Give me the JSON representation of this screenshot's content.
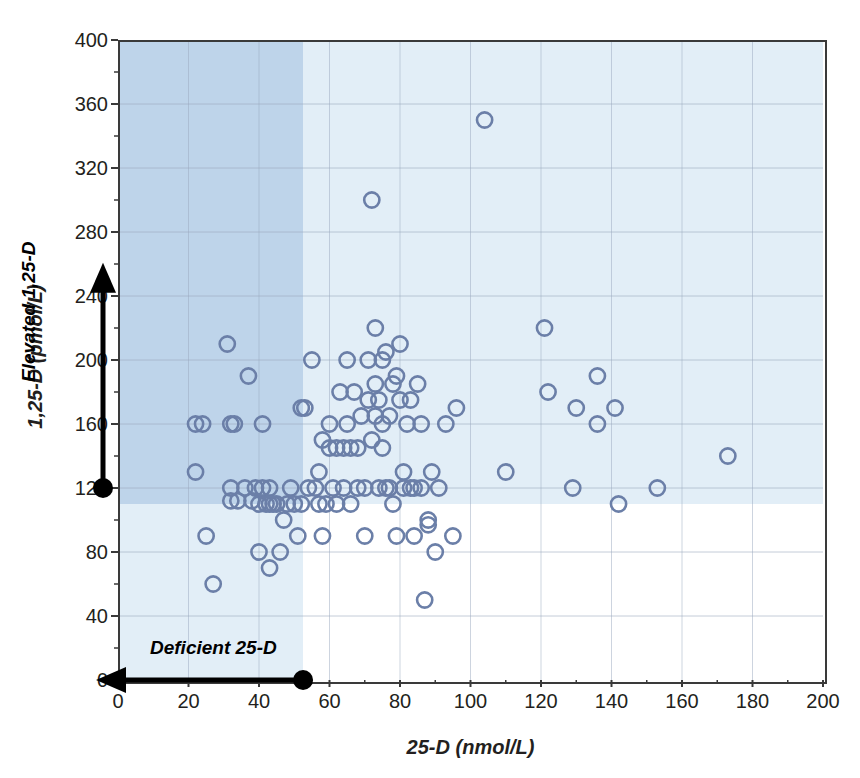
{
  "chart_data": {
    "type": "scatter",
    "title": "",
    "xlabel": "25-D (nmol/L)",
    "ylabel": "1,25-D (pmol/L)",
    "xlim": [
      0,
      200
    ],
    "ylim": [
      0,
      400
    ],
    "xticks": [
      0,
      20,
      40,
      60,
      80,
      100,
      120,
      140,
      160,
      180,
      200
    ],
    "yticks": [
      0,
      40,
      80,
      120,
      160,
      200,
      240,
      280,
      320,
      360,
      400
    ],
    "xtick_labels": [
      "0",
      "20",
      "40",
      "60",
      "80",
      "100",
      "120",
      "140",
      "160",
      "180",
      "200"
    ],
    "ytick_labels": [
      "0",
      "40",
      "80",
      "120",
      "160",
      "200",
      "240",
      "280",
      "320",
      "360",
      "400"
    ],
    "grid": true,
    "legend": "none",
    "marker": "open-circle",
    "marker_color": "#6b7fa8",
    "shaded_regions": [
      {
        "name": "deficient-25-D",
        "orientation": "vertical",
        "x_from": 0,
        "x_to": 52.5,
        "color": "#e2eef7"
      },
      {
        "name": "elevated-1,25-D",
        "orientation": "horizontal",
        "y_from": 110,
        "y_to": 400,
        "color": "#e2eef7"
      },
      {
        "name": "overlap-region",
        "color": "#bed4ea"
      }
    ],
    "annotations": [
      {
        "name": "deficient-25-D",
        "text": "Deficient 25-D",
        "arrow": "left",
        "marker_value": 52.5,
        "axis": "x"
      },
      {
        "name": "elevated-1,25-D",
        "text": "Elevated 1,25-D",
        "arrow": "up",
        "marker_value": 120,
        "axis": "y"
      }
    ],
    "points": [
      [
        22,
        130
      ],
      [
        22,
        160
      ],
      [
        24,
        160
      ],
      [
        25,
        90
      ],
      [
        27,
        60
      ],
      [
        31,
        210
      ],
      [
        32,
        120
      ],
      [
        32,
        112
      ],
      [
        32,
        160
      ],
      [
        33,
        160
      ],
      [
        34,
        112
      ],
      [
        36,
        120
      ],
      [
        37,
        190
      ],
      [
        38,
        112
      ],
      [
        39,
        120
      ],
      [
        40,
        80
      ],
      [
        40,
        110
      ],
      [
        41,
        120
      ],
      [
        41,
        160
      ],
      [
        42,
        110
      ],
      [
        43,
        120
      ],
      [
        43,
        110
      ],
      [
        43,
        70
      ],
      [
        44,
        110
      ],
      [
        45,
        110
      ],
      [
        46,
        80
      ],
      [
        47,
        100
      ],
      [
        48,
        110
      ],
      [
        49,
        120
      ],
      [
        50,
        110
      ],
      [
        51,
        90
      ],
      [
        52,
        110
      ],
      [
        52,
        170
      ],
      [
        53,
        170
      ],
      [
        54,
        120
      ],
      [
        55,
        200
      ],
      [
        56,
        120
      ],
      [
        57,
        110
      ],
      [
        57,
        130
      ],
      [
        58,
        150
      ],
      [
        58,
        90
      ],
      [
        59,
        110
      ],
      [
        60,
        145
      ],
      [
        60,
        160
      ],
      [
        61,
        120
      ],
      [
        62,
        145
      ],
      [
        62,
        110
      ],
      [
        63,
        180
      ],
      [
        64,
        120
      ],
      [
        64,
        145
      ],
      [
        65,
        160
      ],
      [
        65,
        200
      ],
      [
        66,
        145
      ],
      [
        66,
        110
      ],
      [
        67,
        180
      ],
      [
        68,
        120
      ],
      [
        68,
        145
      ],
      [
        69,
        165
      ],
      [
        70,
        120
      ],
      [
        70,
        90
      ],
      [
        71,
        200
      ],
      [
        71,
        175
      ],
      [
        72,
        150
      ],
      [
        72,
        300
      ],
      [
        73,
        220
      ],
      [
        73,
        185
      ],
      [
        73,
        165
      ],
      [
        74,
        120
      ],
      [
        74,
        175
      ],
      [
        75,
        200
      ],
      [
        75,
        145
      ],
      [
        75,
        160
      ],
      [
        76,
        120
      ],
      [
        76,
        205
      ],
      [
        77,
        165
      ],
      [
        77,
        120
      ],
      [
        78,
        185
      ],
      [
        78,
        110
      ],
      [
        79,
        190
      ],
      [
        79,
        90
      ],
      [
        80,
        175
      ],
      [
        80,
        210
      ],
      [
        81,
        130
      ],
      [
        81,
        120
      ],
      [
        82,
        160
      ],
      [
        83,
        175
      ],
      [
        83,
        120
      ],
      [
        84,
        120
      ],
      [
        84,
        90
      ],
      [
        85,
        185
      ],
      [
        86,
        160
      ],
      [
        86,
        120
      ],
      [
        87,
        50
      ],
      [
        88,
        100
      ],
      [
        88,
        97
      ],
      [
        89,
        130
      ],
      [
        90,
        80
      ],
      [
        91,
        120
      ],
      [
        93,
        160
      ],
      [
        95,
        90
      ],
      [
        96,
        170
      ],
      [
        104,
        350
      ],
      [
        110,
        130
      ],
      [
        121,
        220
      ],
      [
        122,
        180
      ],
      [
        129,
        120
      ],
      [
        130,
        170
      ],
      [
        136,
        190
      ],
      [
        136,
        160
      ],
      [
        141,
        170
      ],
      [
        142,
        110
      ],
      [
        153,
        120
      ],
      [
        173,
        140
      ]
    ]
  }
}
